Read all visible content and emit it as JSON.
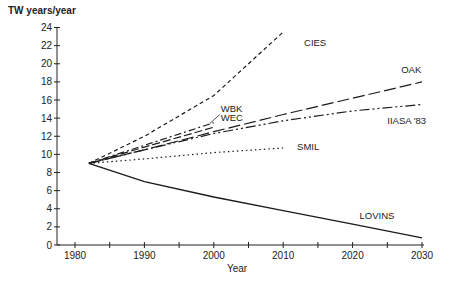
{
  "chart_data": {
    "type": "line",
    "title": "",
    "ylabel": "TW years/year",
    "xlabel": "Year",
    "xlim": [
      1975,
      2032
    ],
    "ylim": [
      0,
      24
    ],
    "x_ticks": [
      1980,
      1990,
      2000,
      2010,
      2020,
      2030
    ],
    "x_minor_ticks": [
      1985,
      1995,
      2005,
      2015,
      2025
    ],
    "y_ticks": [
      0,
      2,
      4,
      6,
      8,
      10,
      12,
      14,
      16,
      18,
      20,
      22,
      24
    ],
    "grid": false,
    "legend": "inline labels",
    "series": [
      {
        "name": "CIES",
        "style": "short-dash",
        "x": [
          1982,
          1990,
          2000,
          2010
        ],
        "y": [
          9.0,
          12.0,
          16.5,
          23.5
        ],
        "label_pos": [
          2013,
          22
        ]
      },
      {
        "name": "OAK",
        "style": "long-dash",
        "x": [
          1982,
          1990,
          2000,
          2010,
          2020,
          2030
        ],
        "y": [
          9.0,
          10.5,
          12.5,
          14.4,
          16.2,
          18.0
        ],
        "label_pos": [
          2027,
          19
        ]
      },
      {
        "name": "IIASA '83",
        "style": "dash-dot-dot",
        "x": [
          1982,
          1990,
          2000,
          2010,
          2020,
          2030
        ],
        "y": [
          9.0,
          10.5,
          12.3,
          13.7,
          14.8,
          15.5
        ],
        "label_pos": [
          2025,
          13.3
        ]
      },
      {
        "name": "WBK",
        "style": "dash-dot",
        "x": [
          1982,
          1990,
          2000
        ],
        "y": [
          9.0,
          11.0,
          13.5
        ],
        "label_pos": [
          2001,
          14.7
        ]
      },
      {
        "name": "WEC",
        "style": "dash",
        "x": [
          1982,
          1990,
          2000
        ],
        "y": [
          9.0,
          10.8,
          13.0
        ],
        "label_pos": [
          2001,
          13.7
        ]
      },
      {
        "name": "SMIL",
        "style": "dotted",
        "x": [
          1982,
          1990,
          2000,
          2010
        ],
        "y": [
          9.0,
          9.5,
          10.2,
          10.7
        ],
        "label_pos": [
          2012,
          10.5
        ]
      },
      {
        "name": "LOVINS",
        "style": "solid",
        "x": [
          1982,
          1990,
          2000,
          2010,
          2020,
          2030
        ],
        "y": [
          9.0,
          7.0,
          5.3,
          3.8,
          2.3,
          0.8
        ],
        "label_pos": [
          2021,
          2.9
        ]
      }
    ]
  },
  "labels": {
    "ylabel": "TW years/year",
    "xlabel": "Year"
  }
}
